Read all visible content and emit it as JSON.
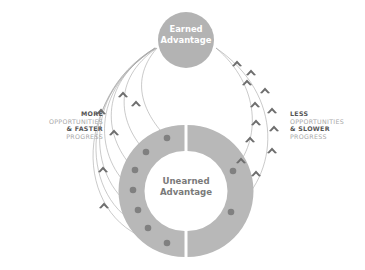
{
  "earned": {
    "line1": "Earned",
    "line2": "Advantage"
  },
  "unearned": {
    "line1": "Unearned",
    "line2": "Advantage"
  },
  "left_label": {
    "line1": "MORE",
    "line2": "OPPORTUNITIES",
    "line3": "& FASTER",
    "line4": "PROGRESS"
  },
  "right_label": {
    "line1": "LESS",
    "line2": "OPPORTUNITIES",
    "line3": "& SLOWER",
    "line4": "PROGRESS"
  },
  "colors": {
    "circle_fill": "#b3b3b3",
    "ring_fill": "#b8b8b8",
    "dot_fill": "#7f7f7f",
    "arrow_fill": "#707070",
    "line_stroke": "#a0a0a0",
    "label_strong": "#555555",
    "label_light": "#a8a8a8"
  },
  "counts": {
    "left_paths": 7,
    "right_paths": 2
  }
}
